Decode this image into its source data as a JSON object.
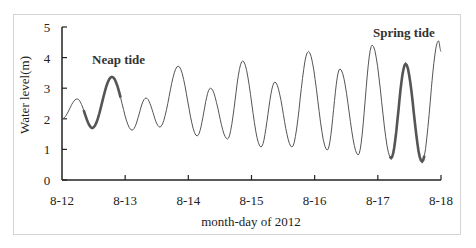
{
  "chart_data": {
    "type": "line",
    "title": "",
    "xlabel": "month-day of 2012",
    "ylabel": "Water level(m)",
    "ylim": [
      0,
      5
    ],
    "yticks": [
      "0",
      "1",
      "2",
      "3",
      "4",
      "5"
    ],
    "xlim_days": [
      0,
      6
    ],
    "xticks": [
      "8-12",
      "8-13",
      "8-14",
      "8-15",
      "8-16",
      "8-17",
      "8-18"
    ],
    "grid": false,
    "legend": "none",
    "annotations": [
      {
        "text": "Neap tide",
        "near": "8-12 to 8-13, highlighted thick segment"
      },
      {
        "text": "Spring tide",
        "near": "8-17 to 8-18, highlighted thick segment"
      }
    ],
    "series": [
      {
        "name": "Water level",
        "x_days": [
          0.0,
          0.24,
          0.48,
          0.79,
          1.11,
          1.33,
          1.55,
          1.84,
          2.14,
          2.35,
          2.62,
          2.86,
          3.15,
          3.37,
          3.64,
          3.9,
          4.2,
          4.4,
          4.69,
          4.91,
          5.21,
          5.44,
          5.7,
          5.96,
          6.0
        ],
        "values": [
          2.0,
          2.65,
          1.7,
          3.37,
          1.63,
          2.68,
          1.73,
          3.72,
          1.44,
          3.0,
          1.34,
          3.89,
          1.08,
          3.2,
          1.08,
          4.2,
          0.98,
          3.63,
          0.82,
          4.41,
          0.72,
          3.79,
          0.6,
          4.55,
          4.2
        ]
      }
    ],
    "highlighted_segments": [
      {
        "label": "Neap tide",
        "x_days_range": [
          0.33,
          0.95
        ]
      },
      {
        "label": "Spring tide",
        "x_days_range": [
          5.17,
          5.74
        ]
      }
    ]
  },
  "labels": {
    "ylabel": "Water level(m)",
    "xlabel": "month-day of 2012",
    "neap": "Neap tide",
    "spring": "Spring tide"
  },
  "colors": {
    "line": "#555555",
    "highlight": "#555555",
    "axis": "#222222",
    "frame": "#d4d4d4"
  }
}
